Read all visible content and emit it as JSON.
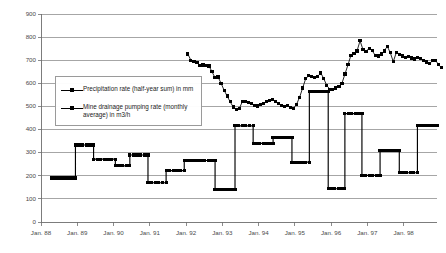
{
  "chart_data": {
    "type": "line",
    "title": "",
    "xlabel": "",
    "ylabel": "",
    "ylim": [
      0,
      900
    ],
    "ytick_step": 100,
    "yticks": [
      "0",
      "100",
      "200",
      "300",
      "400",
      "500",
      "600",
      "700",
      "800",
      "900"
    ],
    "grid": "horizontal",
    "legend_position": "inside-left",
    "x_tick_labels": [
      "Jan. 88",
      "Jan. 89",
      "Jan. 90",
      "Jan. 91",
      "Jan. 92",
      "Jan. 93",
      "Jan. 94",
      "Jan. 95",
      "Jan. 96",
      "Jan. 97",
      "Jan. 98"
    ],
    "x_range_years": [
      1988,
      1998.92
    ],
    "series": [
      {
        "name": "Precipitation rate (half-year sum) in mm",
        "unit": "mm",
        "marker": "square",
        "style": "line-with-markers",
        "color": "#000000",
        "x_start_year": 1992.05,
        "x_step_years": 0.0833,
        "values": [
          727,
          700,
          694,
          690,
          676,
          679,
          677,
          675,
          650,
          624,
          627,
          600,
          570,
          545,
          520,
          498,
          487,
          490,
          520,
          522,
          516,
          514,
          504,
          502,
          509,
          512,
          520,
          524,
          529,
          521,
          513,
          505,
          500,
          504,
          496,
          492,
          510,
          540,
          580,
          620,
          633,
          628,
          624,
          630,
          645,
          620,
          590,
          575,
          572,
          580,
          585,
          600,
          640,
          680,
          722,
          728,
          740,
          784,
          745,
          738,
          752,
          741,
          722,
          718,
          727,
          740,
          760,
          733,
          694,
          733,
          724,
          718,
          712,
          716,
          710,
          705,
          712,
          706,
          700,
          692,
          685,
          698,
          700,
          680,
          668
        ]
      },
      {
        "name": "Mine drainage pumping rate (monthly average) in m3/h",
        "unit": "m3/h",
        "marker": "square",
        "style": "step",
        "color": "#000000",
        "segments": [
          {
            "start_year": 1988.28,
            "end_year": 1988.95,
            "value": 190
          },
          {
            "start_year": 1988.95,
            "end_year": 1989.45,
            "value": 333
          },
          {
            "start_year": 1989.45,
            "end_year": 1990.05,
            "value": 272
          },
          {
            "start_year": 1990.05,
            "end_year": 1990.45,
            "value": 243
          },
          {
            "start_year": 1990.45,
            "end_year": 1990.95,
            "value": 290
          },
          {
            "start_year": 1990.95,
            "end_year": 1991.45,
            "value": 170
          },
          {
            "start_year": 1991.45,
            "end_year": 1991.95,
            "value": 222
          },
          {
            "start_year": 1991.95,
            "end_year": 1992.8,
            "value": 266
          },
          {
            "start_year": 1992.8,
            "end_year": 1993.35,
            "value": 140
          },
          {
            "start_year": 1993.35,
            "end_year": 1993.85,
            "value": 416
          },
          {
            "start_year": 1993.85,
            "end_year": 1994.4,
            "value": 340
          },
          {
            "start_year": 1994.4,
            "end_year": 1994.92,
            "value": 364
          },
          {
            "start_year": 1994.92,
            "end_year": 1995.4,
            "value": 259
          },
          {
            "start_year": 1995.4,
            "end_year": 1995.92,
            "value": 566
          },
          {
            "start_year": 1995.92,
            "end_year": 1996.38,
            "value": 144
          },
          {
            "start_year": 1996.38,
            "end_year": 1996.85,
            "value": 469
          },
          {
            "start_year": 1996.85,
            "end_year": 1997.35,
            "value": 202
          },
          {
            "start_year": 1997.35,
            "end_year": 1997.88,
            "value": 308
          },
          {
            "start_year": 1997.88,
            "end_year": 1998.38,
            "value": 213
          },
          {
            "start_year": 1998.38,
            "end_year": 1998.92,
            "value": 419
          }
        ]
      }
    ]
  },
  "legend": {
    "entries": [
      {
        "label": "Precipitation rate (half-year sum) in mm"
      },
      {
        "label": "Mine drainage pumping rate (monthly average) in m3/h"
      }
    ]
  },
  "axis_colors": {
    "gridline": "#808080",
    "axis": "#6e6e6e",
    "tick_text": "#4a4a4a",
    "series": "#000000"
  }
}
